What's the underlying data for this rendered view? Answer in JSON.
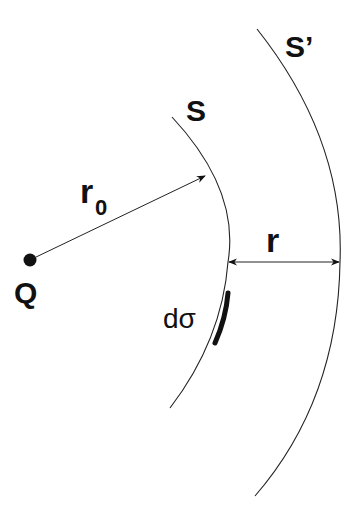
{
  "diagram": {
    "type": "physics-gauss-surfaces",
    "labels": {
      "charge": "Q",
      "inner_surface": "S",
      "outer_surface": "S’",
      "inner_radius": "r",
      "inner_radius_subscript": "0",
      "gap_distance": "r",
      "area_element": "dσ"
    },
    "colors": {
      "ink": "#111111",
      "background": "#ffffff"
    }
  }
}
